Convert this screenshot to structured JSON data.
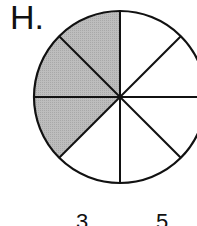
{
  "option_label": "H.",
  "diagram": {
    "type": "fraction-circle",
    "total_sectors": 8,
    "shaded_sectors": 3,
    "shaded_color": "#b8b8b8",
    "line_color": "#111111"
  },
  "bottom_numbers": [
    "3",
    "5"
  ]
}
